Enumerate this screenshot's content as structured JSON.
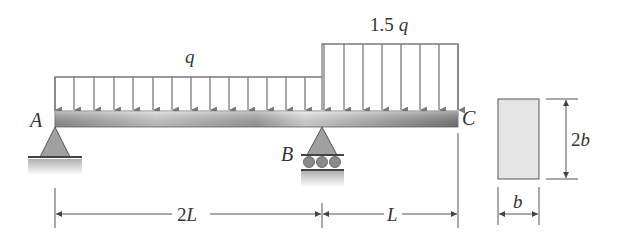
{
  "diagram": {
    "type": "beam-with-distributed-loads",
    "loads": [
      {
        "label": "q",
        "from": "A",
        "to": "B"
      },
      {
        "label_coef": "1.5",
        "label_var": "q",
        "from": "B",
        "to": "C"
      }
    ],
    "points": {
      "A": "A",
      "B": "B",
      "C": "C"
    },
    "dimensions": {
      "span_ab_coef": "2",
      "span_ab_var": "L",
      "span_bc": "L"
    },
    "cross_section": {
      "width": "b",
      "height_coef": "2",
      "height_var": "b"
    },
    "colors": {
      "load_arrow": "#7a7a7a",
      "beam_light": "#e6e6e6",
      "beam_dark": "#8c8c8c",
      "support": "#9a9a9a",
      "section_fill": "#e4e4e4",
      "line": "#555555"
    }
  }
}
